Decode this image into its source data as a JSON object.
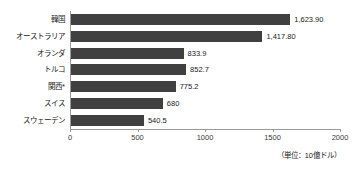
{
  "chart_data": {
    "type": "bar",
    "orientation": "horizontal",
    "title": "",
    "subtitle": "",
    "xlabel": "",
    "ylabel": "",
    "categories": [
      "韓国",
      "オーストラリア",
      "オランダ",
      "トルコ",
      "関西*",
      "スイス",
      "スウェーデン"
    ],
    "values": [
      1623.9,
      1417.8,
      833.9,
      852.7,
      775.2,
      680,
      540.5
    ],
    "value_labels": [
      "1,623.90",
      "1,417.80",
      "833.9",
      "852.7",
      "775.2",
      "680",
      "540.5"
    ],
    "xlim": [
      0,
      2000
    ],
    "xticks": [
      0,
      500,
      1000,
      1500,
      2000
    ],
    "xtick_labels": [
      "0",
      "500",
      "1000",
      "1500",
      "2000"
    ],
    "grid": false,
    "legend": null,
    "bar_color": "#404040",
    "axis_color": "#9a9a9a",
    "background_color": "#ffffff",
    "annotation": "（単位：10億ドル）"
  }
}
